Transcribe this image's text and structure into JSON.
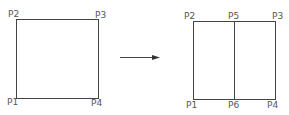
{
  "left_square": {
    "labels": {
      "p1": "P1",
      "p2": "P2",
      "p3": "P3",
      "p4": "P4"
    }
  },
  "right_square": {
    "labels": {
      "p1": "P1",
      "p2": "P2",
      "p3": "P3",
      "p4": "P4",
      "p5": "P5",
      "p6": "P6"
    }
  },
  "colors": {
    "line": "#444444",
    "text": "#555555",
    "background": "#ffffff"
  }
}
